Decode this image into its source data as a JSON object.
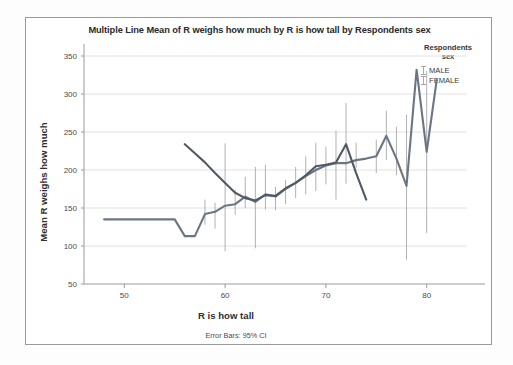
{
  "chart_data": {
    "type": "line",
    "title": "Multiple Line Mean of R weighs how much by R is how tall by Respondents sex",
    "xlabel": "R is how tall",
    "ylabel": "Mean R weighs how much",
    "footnote": "Error Bars: 95% CI",
    "grid": true,
    "legend_position": "top-right",
    "legend_title_line1": "Respondents",
    "legend_title_line2": "sex",
    "xlim": [
      46,
      84
    ],
    "ylim": [
      50,
      350
    ],
    "xticks": [
      50,
      60,
      70,
      80
    ],
    "yticks": [
      50,
      100,
      150,
      200,
      250,
      300,
      350
    ],
    "colors": {
      "male": "#6b7684",
      "female": "#4f5a66",
      "errorbar": "#a8a8a8",
      "grid": "#e2e2e2",
      "axis": "#9a9a9a"
    },
    "series": [
      {
        "name": "MALE",
        "color": "#6b7684",
        "x": [
          48,
          55,
          56,
          57,
          58,
          59,
          60,
          61,
          62,
          63,
          64,
          65,
          66,
          67,
          68,
          69,
          70,
          71,
          72,
          73,
          74,
          75,
          76,
          77,
          78,
          79,
          80,
          81
        ],
        "y": [
          135,
          135,
          113,
          113,
          142,
          145,
          153,
          155,
          165,
          158,
          168,
          165,
          175,
          183,
          192,
          200,
          206,
          209,
          209,
          213,
          215,
          218,
          245,
          215,
          179,
          332,
          224,
          319
        ],
        "ci_low": [
          null,
          null,
          null,
          null,
          128,
          123,
          93,
          141,
          150,
          97,
          148,
          147,
          155,
          163,
          168,
          172,
          181,
          161,
          182,
          203,
          null,
          196,
          213,
          193,
          82,
          null,
          117,
          null
        ],
        "ci_high": [
          null,
          null,
          null,
          null,
          161,
          157,
          235,
          174,
          191,
          204,
          207,
          178,
          187,
          204,
          218,
          236,
          231,
          252,
          288,
          236,
          null,
          240,
          278,
          257,
          273,
          null,
          330,
          null
        ]
      },
      {
        "name": "FEMALE",
        "color": "#4f5a66",
        "x": [
          56,
          57,
          58,
          59,
          60,
          61,
          62,
          63,
          64,
          65,
          66,
          67,
          68,
          69,
          70,
          71,
          72,
          73,
          74
        ],
        "y": [
          234,
          222,
          210,
          196,
          183,
          170,
          163,
          160,
          167,
          166,
          176,
          183,
          193,
          205,
          207,
          210,
          234,
          196,
          161
        ],
        "ci_low": [
          null,
          null,
          null,
          null,
          null,
          null,
          null,
          null,
          null,
          null,
          null,
          null,
          null,
          null,
          null,
          null,
          null,
          null,
          null
        ],
        "ci_high": [
          null,
          null,
          null,
          null,
          null,
          null,
          null,
          null,
          null,
          null,
          null,
          null,
          null,
          null,
          null,
          null,
          null,
          null,
          null
        ]
      }
    ]
  }
}
